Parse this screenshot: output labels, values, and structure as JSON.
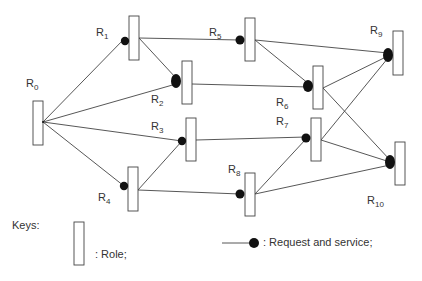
{
  "diagram": {
    "type": "role-network",
    "roles": [
      {
        "id": "R0",
        "base": "R",
        "sub": "0",
        "label_pos": [
          26,
          77
        ]
      },
      {
        "id": "R1",
        "base": "R",
        "sub": "1",
        "label_pos": [
          96,
          26
        ]
      },
      {
        "id": "R2",
        "base": "R",
        "sub": "2",
        "label_pos": [
          151,
          93
        ]
      },
      {
        "id": "R3",
        "base": "R",
        "sub": "3",
        "label_pos": [
          151,
          120
        ]
      },
      {
        "id": "R4",
        "base": "R",
        "sub": "4",
        "label_pos": [
          98,
          191
        ]
      },
      {
        "id": "R5",
        "base": "R",
        "sub": "5",
        "label_pos": [
          209,
          26
        ]
      },
      {
        "id": "R6",
        "base": "R",
        "sub": "6",
        "label_pos": [
          276,
          96
        ]
      },
      {
        "id": "R7",
        "base": "R",
        "sub": "7",
        "label_pos": [
          276,
          115
        ]
      },
      {
        "id": "R8",
        "base": "R",
        "sub": "8",
        "label_pos": [
          226,
          163
        ]
      },
      {
        "id": "R9",
        "base": "R",
        "sub": "9",
        "label_pos": [
          370,
          24
        ]
      },
      {
        "id": "R10",
        "base": "R",
        "sub": "10",
        "label_pos": [
          367,
          192
        ]
      }
    ],
    "edges": [
      {
        "from": "R0",
        "to": "R1"
      },
      {
        "from": "R0",
        "to": "R2"
      },
      {
        "from": "R0",
        "to": "R3"
      },
      {
        "from": "R0",
        "to": "R4"
      },
      {
        "from": "R1",
        "to": "R2"
      },
      {
        "from": "R1",
        "to": "R5"
      },
      {
        "from": "R2",
        "to": "R6"
      },
      {
        "from": "R4",
        "to": "R3"
      },
      {
        "from": "R4",
        "to": "R8"
      },
      {
        "from": "R3",
        "to": "R7"
      },
      {
        "from": "R5",
        "to": "R6"
      },
      {
        "from": "R5",
        "to": "R9"
      },
      {
        "from": "R6",
        "to": "R9"
      },
      {
        "from": "R6",
        "to": "R10"
      },
      {
        "from": "R7",
        "to": "R9"
      },
      {
        "from": "R7",
        "to": "R10"
      },
      {
        "from": "R8",
        "to": "R7"
      },
      {
        "from": "R8",
        "to": "R10"
      }
    ]
  },
  "keys": {
    "title": "Keys:",
    "role_label": ": Role;",
    "request_label": ": Request and service;"
  }
}
